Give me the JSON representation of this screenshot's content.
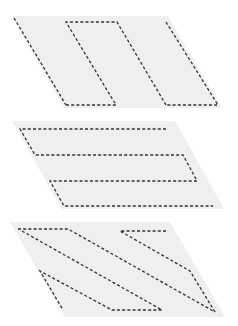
{
  "diagram": {
    "colors": {
      "background": "#ffffff",
      "shape_fill": "#efefef",
      "dash_stroke": "#333333"
    },
    "figures": [
      {
        "id": "vertical-strips",
        "outline": [
          [
            12,
            16
          ],
          [
            168,
            16
          ],
          [
            222,
            108
          ],
          [
            64,
            108
          ]
        ],
        "dashed_paths": [
          [
            [
              14,
              18
            ],
            [
              66,
              105
            ]
          ],
          [
            [
              66,
              105
            ],
            [
              116,
              105
            ],
            [
              66,
              22
            ],
            [
              117,
              22
            ],
            [
              166,
              105
            ]
          ],
          [
            [
              166,
              22
            ],
            [
              218,
              105
            ],
            [
              166,
              105
            ]
          ]
        ]
      },
      {
        "id": "horizontal-strips",
        "outline": [
          [
            12,
            121
          ],
          [
            175,
            121
          ],
          [
            224,
            209
          ],
          [
            62,
            209
          ]
        ],
        "dashed_paths": [
          [
            [
              166,
              129
            ],
            [
              20,
              129
            ],
            [
              35,
              155
            ],
            [
              183,
              155
            ],
            [
              197,
              181
            ],
            [
              50,
              181
            ],
            [
              64,
              206
            ],
            [
              213,
              206
            ]
          ]
        ]
      },
      {
        "id": "diagonal-strips",
        "outline": [
          [
            10,
            222
          ],
          [
            170,
            222
          ],
          [
            225,
            317
          ],
          [
            65,
            317
          ]
        ],
        "dashed_paths": [
          [
            [
              18,
              229
            ],
            [
              68,
              229
            ],
            [
              215,
              312
            ]
          ],
          [
            [
              22,
              231
            ],
            [
              162,
              310
            ],
            [
              112,
              310
            ],
            [
              40,
              271
            ],
            [
              63,
              310
            ]
          ],
          [
            [
              166,
              231
            ],
            [
              120,
              231
            ],
            [
              190,
              271
            ],
            [
              215,
              312
            ]
          ]
        ]
      }
    ]
  }
}
